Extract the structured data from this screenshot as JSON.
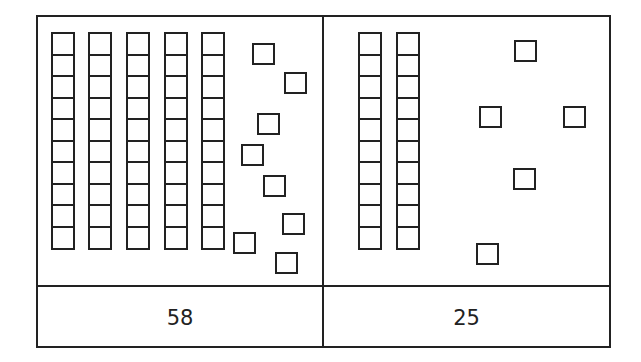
{
  "panels": [
    {
      "value_label": "58",
      "tens": 5,
      "ones": 8,
      "rods_x": [
        51,
        88,
        126,
        164,
        201
      ],
      "cubes": [
        [
          252,
          43
        ],
        [
          284,
          72
        ],
        [
          257,
          113
        ],
        [
          241,
          144
        ],
        [
          263,
          175
        ],
        [
          282,
          213
        ],
        [
          233,
          232
        ],
        [
          275,
          252
        ]
      ]
    },
    {
      "value_label": "25",
      "tens": 2,
      "ones": 5,
      "rods_x": [
        358,
        396
      ],
      "cubes": [
        [
          514,
          40
        ],
        [
          479,
          106
        ],
        [
          563,
          106
        ],
        [
          513,
          168
        ],
        [
          476,
          243
        ]
      ]
    }
  ],
  "colors": {
    "line": "#222222",
    "background": "#ffffff"
  },
  "rod_units": 10,
  "rod_top": 32
}
